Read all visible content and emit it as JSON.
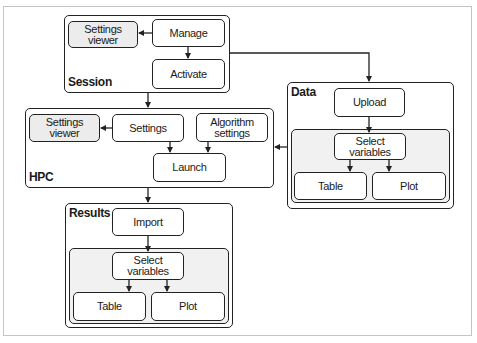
{
  "diagram": {
    "groups": {
      "session": {
        "label": "Session",
        "nodes": {
          "settings_viewer": "Settings viewer",
          "manage": "Manage",
          "activate": "Activate"
        }
      },
      "hpc": {
        "label": "HPC",
        "nodes": {
          "settings_viewer": "Settings viewer",
          "settings": "Settings",
          "algorithm_settings": "Algorithm settings",
          "launch": "Launch"
        }
      },
      "data": {
        "label": "Data",
        "nodes": {
          "upload": "Upload",
          "select_variables": "Select variables",
          "table": "Table",
          "plot": "Plot"
        }
      },
      "results": {
        "label": "Results",
        "nodes": {
          "import": "Import",
          "select_variables": "Select variables",
          "table": "Table",
          "plot": "Plot"
        }
      }
    },
    "edges": [
      {
        "from": "Session.Manage",
        "to": "Session.Settings viewer"
      },
      {
        "from": "Session.Manage",
        "to": "Session.Activate"
      },
      {
        "from": "Session",
        "to": "HPC"
      },
      {
        "from": "Session",
        "to": "Data"
      },
      {
        "from": "HPC.Settings",
        "to": "HPC.Settings viewer"
      },
      {
        "from": "HPC.Settings",
        "to": "HPC.Launch"
      },
      {
        "from": "HPC.Algorithm settings",
        "to": "HPC.Launch"
      },
      {
        "from": "Data",
        "to": "HPC"
      },
      {
        "from": "HPC",
        "to": "Results"
      },
      {
        "from": "Data.Upload",
        "to": "Data.Select variables"
      },
      {
        "from": "Data.Select variables",
        "to": "Data.Table"
      },
      {
        "from": "Data.Select variables",
        "to": "Data.Plot"
      },
      {
        "from": "Results.Import",
        "to": "Results.Select variables"
      },
      {
        "from": "Results.Select variables",
        "to": "Results.Table"
      },
      {
        "from": "Results.Select variables",
        "to": "Results.Plot"
      }
    ],
    "colors": {
      "stroke": "#222222",
      "node_fill": "#ffffff",
      "highlight_fill": "#ececec",
      "inner_panel_fill": "#f1f1f1",
      "frame_border": "#c4c4c4"
    }
  }
}
